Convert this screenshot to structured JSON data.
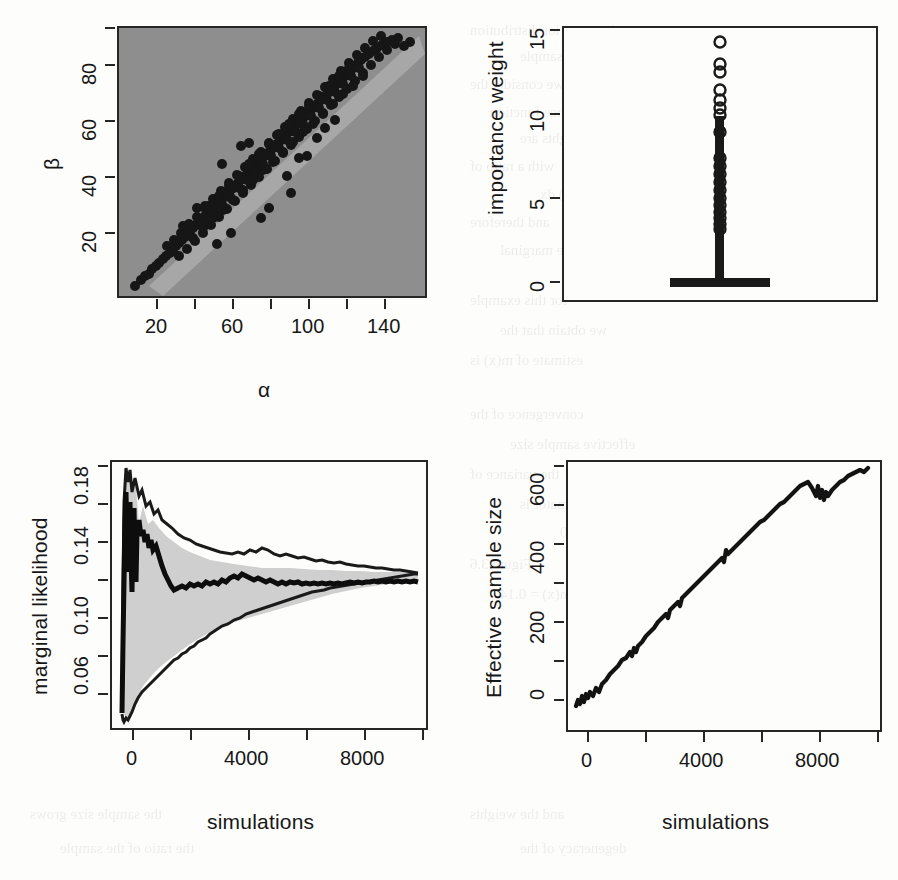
{
  "figure": {
    "background_color": "#fdfdfb",
    "ink_color": "#262626",
    "panel_fill_gray": "#8e8e8e",
    "band_fill_gray": "#cfcfcf"
  },
  "bleed_text": [
    {
      "t": "the posterior distribution",
      "x": 470,
      "y": 22
    },
    {
      "t": "simulate the sample",
      "x": 520,
      "y": 48
    },
    {
      "t": "we consider the",
      "x": 470,
      "y": 76
    },
    {
      "t": "importance function",
      "x": 490,
      "y": 104
    },
    {
      "t": "the weights are",
      "x": 520,
      "y": 130
    },
    {
      "t": "with a ratio of",
      "x": 470,
      "y": 158
    },
    {
      "t": "p(x) q(x) dx",
      "x": 540,
      "y": 186
    },
    {
      "t": "and therefore",
      "x": 470,
      "y": 214
    },
    {
      "t": "the marginal",
      "x": 500,
      "y": 242
    },
    {
      "t": "for this example",
      "x": 470,
      "y": 292
    },
    {
      "t": "we obtain that the",
      "x": 500,
      "y": 322
    },
    {
      "t": "estimate of m(x) is",
      "x": 470,
      "y": 352
    },
    {
      "t": "convergence of the",
      "x": 470,
      "y": 406
    },
    {
      "t": "effective sample size",
      "x": 510,
      "y": 436
    },
    {
      "t": "the variance of",
      "x": 470,
      "y": 466
    },
    {
      "t": "estimator is",
      "x": 520,
      "y": 496
    },
    {
      "t": "n = 10000",
      "x": 560,
      "y": 524
    },
    {
      "t": "Figure 3.6",
      "x": 470,
      "y": 556
    },
    {
      "t": "m(x) = 0.14",
      "x": 500,
      "y": 586
    },
    {
      "t": "(b)",
      "x": 570,
      "y": 616
    },
    {
      "t": "the sample size grows",
      "x": 30,
      "y": 806
    },
    {
      "t": "and the weights",
      "x": 470,
      "y": 806
    },
    {
      "t": "the ratio of the sample",
      "x": 60,
      "y": 840
    },
    {
      "t": "degeneracy of the",
      "x": 520,
      "y": 840
    }
  ],
  "chart_data": [
    {
      "id": "alpha-beta-scatter",
      "panel": "top-left",
      "type": "scatter",
      "title": "",
      "xlabel": "α",
      "ylabel": "β",
      "xlim": [
        5,
        150
      ],
      "ylim": [
        5,
        100
      ],
      "xticks": [
        20,
        40,
        60,
        80,
        100,
        120,
        140
      ],
      "xtick_labels": [
        "20",
        "",
        "60",
        "",
        "100",
        "",
        "140"
      ],
      "yticks": [
        20,
        40,
        60,
        80,
        100
      ],
      "ytick_labels": [
        "20",
        "40",
        "60",
        "80",
        ""
      ],
      "grid": false,
      "legend": "none",
      "point_color": "#1a1a1a",
      "plot_background": "#8e8e8e",
      "n_points": 330,
      "note": "posterior sample of (alpha, beta) lying on a tight positively correlated ridge"
    },
    {
      "id": "importance-weight-boxplot",
      "panel": "top-right",
      "type": "boxplot",
      "title": "",
      "xlabel": "",
      "ylabel": "importance weight",
      "ylim": [
        0,
        15
      ],
      "yticks": [
        0,
        5,
        10,
        15
      ],
      "ytick_labels": [
        "0",
        "5",
        "10",
        "15"
      ],
      "grid": false,
      "legend": "none",
      "box": {
        "min": 0.0,
        "q1": 0.02,
        "median": 0.1,
        "q3": 0.35,
        "max_whisker": 4.6
      },
      "outliers": [
        4.8,
        5.0,
        5.1,
        5.2,
        5.4,
        5.5,
        5.7,
        5.9,
        6.1,
        6.3,
        6.5,
        6.8,
        7.0,
        7.2,
        7.5,
        7.8,
        8.1,
        8.4,
        8.8,
        9.9,
        11.2,
        11.4,
        11.7,
        12.0,
        12.3,
        12.6,
        13.2,
        13.4,
        14.2
      ],
      "note": "highly skewed weights, most near zero with a long upper tail"
    },
    {
      "id": "marginal-likelihood-convergence",
      "panel": "bottom-left",
      "type": "area",
      "title": "",
      "xlabel": "simulations",
      "ylabel": "marginal likelihood",
      "xlim": [
        0,
        10000
      ],
      "ylim": [
        0.04,
        0.188
      ],
      "xticks": [
        0,
        2000,
        4000,
        6000,
        8000,
        10000
      ],
      "xtick_labels": [
        "0",
        "",
        "4000",
        "",
        "8000",
        ""
      ],
      "yticks": [
        0.06,
        0.08,
        0.1,
        0.12,
        0.14,
        0.16,
        0.18
      ],
      "ytick_labels": [
        "0.06",
        "",
        "0.10",
        "",
        "0.14",
        "",
        "0.18"
      ],
      "grid": false,
      "legend": "none",
      "band_fill": "#cfcfcf",
      "converges_to": 0.135,
      "series": [
        {
          "name": "running estimate",
          "style": "solid-bold"
        },
        {
          "name": "upper confidence band",
          "style": "solid"
        },
        {
          "name": "lower confidence band",
          "style": "solid"
        }
      ],
      "note": "running estimate with shrinking 95% confidence band converging near 0.135"
    },
    {
      "id": "effective-sample-size",
      "panel": "bottom-right",
      "type": "line",
      "title": "",
      "xlabel": "simulations",
      "ylabel": "Effective sample size",
      "xlim": [
        0,
        10000
      ],
      "ylim": [
        0,
        640
      ],
      "xticks": [
        0,
        2000,
        4000,
        6000,
        8000,
        10000
      ],
      "xtick_labels": [
        "0",
        "",
        "4000",
        "",
        "8000",
        ""
      ],
      "yticks": [
        0,
        100,
        200,
        300,
        400,
        500,
        600
      ],
      "ytick_labels": [
        "0",
        "",
        "200",
        "",
        "400",
        "",
        "600"
      ],
      "grid": false,
      "legend": "none",
      "x": [
        0,
        200,
        400,
        600,
        900,
        1200,
        1500,
        1800,
        2100,
        2400,
        2700,
        3000,
        3300,
        3600,
        3900,
        4200,
        4500,
        4800,
        5000,
        5200,
        5600,
        6000,
        6400,
        6800,
        7200,
        7600,
        8000,
        8200,
        8400,
        8600,
        8800,
        9200,
        9600,
        10000
      ],
      "values": [
        8,
        18,
        22,
        30,
        44,
        60,
        74,
        88,
        104,
        120,
        138,
        155,
        172,
        190,
        208,
        228,
        250,
        272,
        295,
        300,
        330,
        362,
        396,
        430,
        462,
        496,
        528,
        556,
        540,
        556,
        545,
        572,
        596,
        622
      ],
      "note": "ESS grows approximately linearly to about 620 after 10000 simulations"
    }
  ]
}
